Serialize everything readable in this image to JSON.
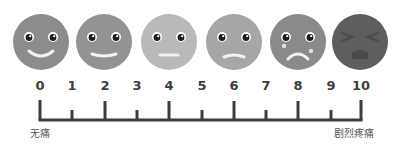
{
  "faces": [
    {
      "level": 0,
      "cx": 41,
      "expression": "big-smile",
      "color": "#8c8c8c"
    },
    {
      "level": 2,
      "cx": 104,
      "expression": "smile",
      "color": "#939393"
    },
    {
      "level": 4,
      "cx": 169,
      "expression": "neutral",
      "color": "#b9b9b9"
    },
    {
      "level": 6,
      "cx": 234,
      "expression": "slight-frown",
      "color": "#a6a6a6"
    },
    {
      "level": 8,
      "cx": 298,
      "expression": "crying",
      "color": "#8a8a8a"
    },
    {
      "level": 10,
      "cx": 360,
      "expression": "agony",
      "color": "#5e5e5e"
    }
  ],
  "scale": {
    "ticks": [
      "0",
      "1",
      "2",
      "3",
      "4",
      "5",
      "6",
      "7",
      "8",
      "9",
      "10"
    ],
    "tick_x": [
      40,
      72,
      105,
      137,
      169,
      202,
      234,
      266,
      298,
      331,
      361
    ],
    "line_color": "#3d3d3d"
  },
  "labels": {
    "min": "无痛",
    "max": "剧烈疼痛"
  }
}
